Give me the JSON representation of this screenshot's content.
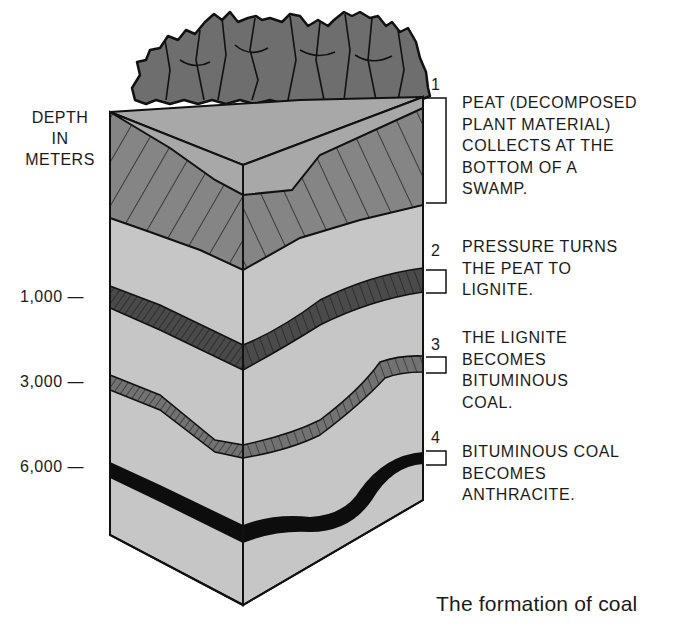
{
  "figure": {
    "caption": "The formation of coal",
    "axis": {
      "title_lines": [
        "DEPTH",
        "IN",
        "METERS"
      ],
      "ticks": [
        {
          "label": "1,000 —",
          "y": 298
        },
        {
          "label": "3,000 —",
          "y": 383
        },
        {
          "label": "6,000 —",
          "y": 468
        }
      ]
    },
    "steps": [
      {
        "number": "1",
        "lines": [
          "PEAT (DECOMPOSED",
          "PLANT MATERIAL)",
          "COLLECTS AT THE",
          "BOTTOM OF A",
          "SWAMP."
        ]
      },
      {
        "number": "2",
        "lines": [
          "PRESSURE TURNS",
          "THE PEAT TO",
          "LIGNITE."
        ]
      },
      {
        "number": "3",
        "lines": [
          "THE LIGNITE",
          "BECOMES",
          "BITUMINOUS",
          "COAL."
        ]
      },
      {
        "number": "4",
        "lines": [
          "BITUMINOUS COAL",
          "BECOMES",
          "ANTHRACITE."
        ]
      }
    ],
    "colors": {
      "outline": "#111111",
      "trees": "#6e6e6e",
      "peat": "#858585",
      "rock": "#c6c6c6",
      "top_surface": "#a8a8a8",
      "lignite": "#4a4a4a",
      "bituminous": "#727272",
      "anthracite": "#0d0d0d"
    }
  }
}
